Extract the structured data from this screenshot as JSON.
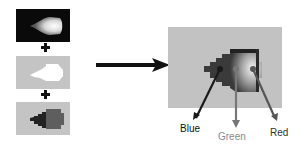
{
  "diagram": {
    "title": "",
    "inputs": [
      {
        "id": "panel-black",
        "description": "white glow flame on black background"
      },
      {
        "id": "panel-gray1",
        "description": "white pixelated shape on gray background"
      },
      {
        "id": "panel-gray2",
        "description": "dark gray pixelated shape on gray background"
      }
    ],
    "operators": [
      "+",
      "+"
    ],
    "output": {
      "description": "composite shaded pixel shape on gray background"
    },
    "arrow_labels": {
      "blue": "Blue",
      "green": "Green",
      "red": "Red"
    },
    "colors": {
      "panel_black": "#0a0a0a",
      "panel_gray": "#c4c4c4",
      "label_blue": "#111111",
      "label_green": "#8a8a8a",
      "label_red": "#333333"
    }
  }
}
